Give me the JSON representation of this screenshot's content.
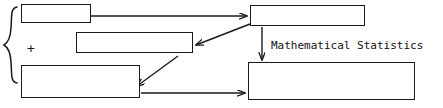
{
  "diagram": {
    "stroke_color": "#1a1a1a",
    "background_color": "#ffffff",
    "nodes": [
      {
        "id": "data",
        "label": "Data (1)"
      },
      {
        "id": "decision",
        "label": "Decision",
        "superscript": "(3)"
      },
      {
        "id": "information",
        "label": "Information (2)\naccurate enough"
      },
      {
        "id": "formulae",
        "label": "FORMULAE"
      },
      {
        "id": "statspace",
        "label": "Statistical space (4)"
      }
    ],
    "operators": {
      "plus": "+",
      "group_brace": "{"
    },
    "edge_labels": {
      "math_statistics": "Mathematical Statistics"
    },
    "edges": [
      {
        "id": "data-to-formulae",
        "from": "data",
        "to": "formulae",
        "style": "horizontal-arrow"
      },
      {
        "id": "formulae-to-decision",
        "from": "formulae",
        "to": "decision",
        "style": "diagonal-arrow"
      },
      {
        "id": "decision-to-information",
        "from": "decision",
        "to": "information",
        "style": "diagonal-arrow"
      },
      {
        "id": "formulae-to-statspace",
        "from": "formulae",
        "to": "statspace",
        "style": "vertical-arrow",
        "label": "Mathematical Statistics"
      },
      {
        "id": "information-to-statspace",
        "from": "information",
        "to": "statspace",
        "style": "horizontal-arrow"
      }
    ]
  }
}
